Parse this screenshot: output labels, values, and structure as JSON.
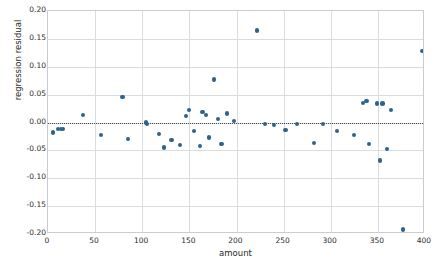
{
  "chart_data": {
    "type": "scatter",
    "title": "",
    "xlabel": "amount",
    "ylabel": "regression residual",
    "xlim": [
      0,
      400
    ],
    "ylim": [
      -0.2,
      0.2
    ],
    "xticks": [
      0,
      50,
      100,
      150,
      200,
      250,
      300,
      350,
      400
    ],
    "xticklabels": [
      "0",
      "50",
      "100",
      "150",
      "200",
      "250",
      "300",
      "350",
      "400"
    ],
    "yticks": [
      -0.2,
      -0.15,
      -0.1,
      -0.05,
      0.0,
      0.05,
      0.1,
      0.15,
      0.2
    ],
    "yticklabels": [
      "-0.20",
      "-0.15",
      "-0.10",
      "-0.05",
      "0.00",
      "0.05",
      "0.10",
      "0.15",
      "0.20"
    ],
    "grid": true,
    "legend": "none",
    "marker_color": "#31628c",
    "reference_line": {
      "y": 0.0,
      "style": "dotted",
      "color": "#4a4a4a"
    },
    "series": [
      {
        "name": "regression residual",
        "x": [
          5,
          11,
          14,
          16,
          37,
          56,
          79,
          85,
          104,
          105,
          118,
          123,
          131,
          140,
          146,
          150,
          155,
          161,
          164,
          168,
          171,
          176,
          180,
          184,
          190,
          197,
          222,
          230,
          240,
          252,
          264,
          282,
          292,
          307,
          325,
          334,
          338,
          341,
          349,
          352,
          355,
          360,
          364,
          377,
          397
        ],
        "y": [
          -0.018,
          -0.012,
          -0.011,
          -0.011,
          0.014,
          -0.022,
          0.046,
          -0.029,
          0.0,
          -0.002,
          -0.02,
          -0.045,
          -0.032,
          -0.041,
          0.011,
          0.022,
          -0.015,
          -0.042,
          0.019,
          0.013,
          -0.027,
          0.077,
          0.006,
          -0.038,
          0.016,
          0.002,
          0.165,
          -0.003,
          -0.004,
          -0.013,
          -0.003,
          -0.037,
          -0.002,
          -0.015,
          -0.022,
          0.035,
          0.038,
          -0.038,
          0.034,
          -0.068,
          0.034,
          -0.048,
          0.022,
          -0.192,
          0.128
        ]
      }
    ]
  }
}
